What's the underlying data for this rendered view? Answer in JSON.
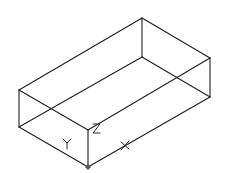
{
  "drawing": {
    "type": "isometric-wireframe-box",
    "background": "#ffffff",
    "line_color": "#1e1e1e",
    "vertices": {
      "top_back": [
        142,
        18
      ],
      "top_right": [
        210,
        58
      ],
      "top_left": [
        19,
        90
      ],
      "top_front": [
        88,
        130
      ],
      "bottom_back": [
        142,
        57
      ],
      "bottom_right": [
        210,
        97
      ],
      "bottom_left": [
        19,
        127
      ],
      "bottom_front": [
        88,
        167
      ]
    },
    "axis_labels": {
      "x": "X",
      "y": "Y",
      "z": "Z"
    },
    "ucs_origin": [
      88,
      167
    ]
  }
}
